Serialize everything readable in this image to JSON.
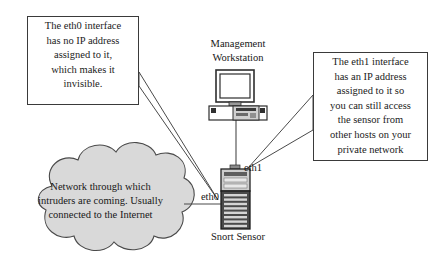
{
  "diagram": {
    "background_color": "#ffffff",
    "line_color": "#3a3a3a",
    "cloud_fill": "#d9d9d9",
    "callouts": [
      {
        "id": "eth0-callout",
        "lines": [
          "The eth0 interface",
          "has no IP address",
          "assigned to it,",
          "which makes it",
          "invisible."
        ]
      },
      {
        "id": "eth1-callout",
        "lines": [
          "The eth1 interface",
          "has an IP address",
          "assigned to it so",
          "you can still access",
          "the sensor from",
          "other hosts on your",
          "private network"
        ]
      }
    ],
    "cloud": {
      "lines": [
        "Network through which",
        "intruders are coming. Usually",
        "connected to the Internet"
      ]
    },
    "nodes": {
      "workstation_label_line1": "Management",
      "workstation_label_line2": "Workstation",
      "sensor_label": "Snort Sensor"
    },
    "interfaces": {
      "eth0": "eth0",
      "eth1": "eth1"
    },
    "icons": {
      "workstation": "desktop-computer-icon",
      "sensor": "tower-server-icon",
      "network": "cloud-icon"
    }
  }
}
